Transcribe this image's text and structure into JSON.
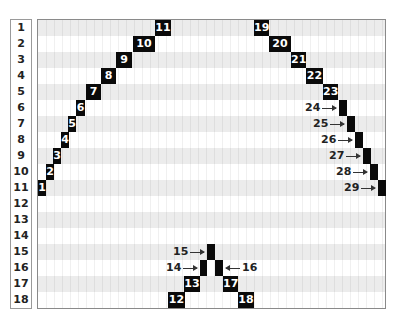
{
  "rows": [
    "1",
    "2",
    "3",
    "4",
    "5",
    "6",
    "7",
    "8",
    "9",
    "10",
    "11",
    "12",
    "13",
    "14",
    "15",
    "16",
    "17",
    "18"
  ],
  "blocks": [
    {
      "label": "1",
      "row": 11,
      "x": 0,
      "w": 8
    },
    {
      "label": "2",
      "row": 10,
      "x": 8,
      "w": 8
    },
    {
      "label": "3",
      "row": 9,
      "x": 15,
      "w": 8
    },
    {
      "label": "4",
      "row": 8,
      "x": 23,
      "w": 8
    },
    {
      "label": "5",
      "row": 7,
      "x": 30,
      "w": 8
    },
    {
      "label": "6",
      "row": 6,
      "x": 38,
      "w": 9
    },
    {
      "label": "7",
      "row": 5,
      "x": 48,
      "w": 15
    },
    {
      "label": "8",
      "row": 4,
      "x": 63,
      "w": 15
    },
    {
      "label": "9",
      "row": 3,
      "x": 78,
      "w": 16
    },
    {
      "label": "10",
      "row": 2,
      "x": 95,
      "w": 22
    },
    {
      "label": "11",
      "row": 1,
      "x": 117,
      "w": 16
    },
    {
      "label": "12",
      "row": 18,
      "x": 130,
      "w": 17
    },
    {
      "label": "13",
      "row": 17,
      "x": 146,
      "w": 16
    },
    {
      "label": "14",
      "row": 16,
      "x": 162,
      "w": 7,
      "callout": "left"
    },
    {
      "label": "15",
      "row": 15,
      "x": 169,
      "w": 8,
      "callout": "left"
    },
    {
      "label": "16",
      "row": 16,
      "x": 177,
      "w": 8,
      "callout": "right"
    },
    {
      "label": "17",
      "row": 17,
      "x": 185,
      "w": 15
    },
    {
      "label": "18",
      "row": 18,
      "x": 200,
      "w": 16
    },
    {
      "label": "19",
      "row": 1,
      "x": 216,
      "w": 15
    },
    {
      "label": "20",
      "row": 2,
      "x": 231,
      "w": 22
    },
    {
      "label": "21",
      "row": 3,
      "x": 253,
      "w": 15
    },
    {
      "label": "22",
      "row": 4,
      "x": 268,
      "w": 17
    },
    {
      "label": "23",
      "row": 5,
      "x": 285,
      "w": 15
    },
    {
      "label": "24",
      "row": 6,
      "x": 301,
      "w": 8,
      "callout": "left"
    },
    {
      "label": "25",
      "row": 7,
      "x": 309,
      "w": 8,
      "callout": "left"
    },
    {
      "label": "26",
      "row": 8,
      "x": 317,
      "w": 8,
      "callout": "left"
    },
    {
      "label": "27",
      "row": 9,
      "x": 325,
      "w": 8,
      "callout": "left"
    },
    {
      "label": "28",
      "row": 10,
      "x": 332,
      "w": 8,
      "callout": "left"
    },
    {
      "label": "29",
      "row": 11,
      "x": 340,
      "w": 8,
      "callout": "left"
    }
  ],
  "colors": {
    "block": "#0a0a0a",
    "block_text": "#ffffff",
    "band_shaded": "#ececec",
    "border": "#8a8a8a"
  }
}
